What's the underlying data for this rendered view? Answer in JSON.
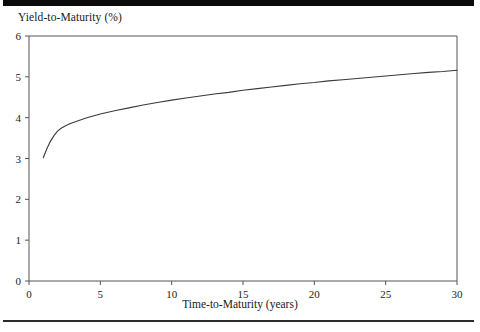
{
  "chart_data": {
    "type": "line",
    "title": "",
    "ylabel": "Yield-to-Maturity (%)",
    "xlabel": "Time-to-Maturity (years)",
    "xlim": [
      0,
      30
    ],
    "ylim": [
      0,
      6
    ],
    "xticks": [
      0,
      5,
      10,
      15,
      20,
      25,
      30
    ],
    "yticks": [
      0,
      1,
      2,
      3,
      4,
      5,
      6
    ],
    "grid": false,
    "legend": false,
    "legend_position": "none",
    "line_color": "#3a3a3a",
    "series": [
      {
        "name": "Yield curve",
        "x": [
          1,
          1.25,
          1.5,
          1.75,
          2,
          2.25,
          2.5,
          2.75,
          3,
          3.5,
          4,
          4.5,
          5,
          6,
          7,
          8,
          9,
          10,
          11,
          12,
          13,
          14,
          15,
          16,
          17,
          18,
          19,
          20,
          21,
          22,
          23,
          24,
          25,
          26,
          27,
          28,
          29,
          30
        ],
        "values": [
          3.02,
          3.24,
          3.42,
          3.56,
          3.67,
          3.74,
          3.79,
          3.83,
          3.87,
          3.93,
          3.99,
          4.04,
          4.09,
          4.17,
          4.24,
          4.31,
          4.37,
          4.43,
          4.48,
          4.53,
          4.58,
          4.62,
          4.67,
          4.71,
          4.75,
          4.79,
          4.83,
          4.86,
          4.9,
          4.93,
          4.96,
          4.99,
          5.02,
          5.05,
          5.08,
          5.11,
          5.13,
          5.16
        ]
      }
    ]
  },
  "axes": {
    "y_axis_title": "Yield-to-Maturity (%)",
    "x_axis_title": "Time-to-Maturity (years)",
    "y_tick_labels": [
      "0",
      "1",
      "2",
      "3",
      "4",
      "5",
      "6"
    ],
    "x_tick_labels": [
      "0",
      "5",
      "10",
      "15",
      "20",
      "25",
      "30"
    ]
  },
  "colors": {
    "rule": "#0b0b0b",
    "axis": "#555555",
    "line": "#3a3a3a",
    "background": "#ffffff"
  }
}
